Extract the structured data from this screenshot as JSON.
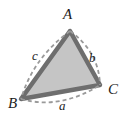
{
  "figure": {
    "kind": "geometry-diagram",
    "canvas": {
      "width": 125,
      "height": 123,
      "background": "#ffffff"
    },
    "colors": {
      "triangle_fill": "#c5c5c5",
      "triangle_stroke": "#6e6e6e",
      "dashed_arc": "#9a9a9a",
      "label_text": "#1c1c1c",
      "background": "#ffffff"
    },
    "triangle": {
      "stroke_width": 4.5,
      "vertices": [
        {
          "name": "A",
          "x": 70,
          "y": 31
        },
        {
          "name": "B",
          "x": 21,
          "y": 99
        },
        {
          "name": "C",
          "x": 100,
          "y": 85
        }
      ]
    },
    "vertex_labels": [
      {
        "id": "A",
        "text": "A"
      },
      {
        "id": "B",
        "text": "B"
      },
      {
        "id": "C",
        "text": "C"
      }
    ],
    "side_labels": [
      {
        "id": "a",
        "text": "a",
        "opposite_vertex": "A",
        "between": "B-C"
      },
      {
        "id": "b",
        "text": "b",
        "opposite_vertex": "B",
        "between": "A-C"
      },
      {
        "id": "c",
        "text": "c",
        "opposite_vertex": "C",
        "between": "A-B"
      }
    ],
    "dashed_arcs": [
      {
        "id": "arc-a",
        "from": "B",
        "to": "C",
        "bows": "outward-down",
        "control": {
          "x": 60,
          "y": 110
        },
        "dash": "4 3"
      },
      {
        "id": "arc-b",
        "from": "A",
        "to": "C",
        "bows": "outward-right",
        "control": {
          "x": 99,
          "y": 52
        },
        "dash": "4 3"
      },
      {
        "id": "arc-c",
        "from": "A",
        "to": "B",
        "bows": "outward-left",
        "control": {
          "x": 33,
          "y": 58
        },
        "dash": "4 3"
      }
    ]
  }
}
